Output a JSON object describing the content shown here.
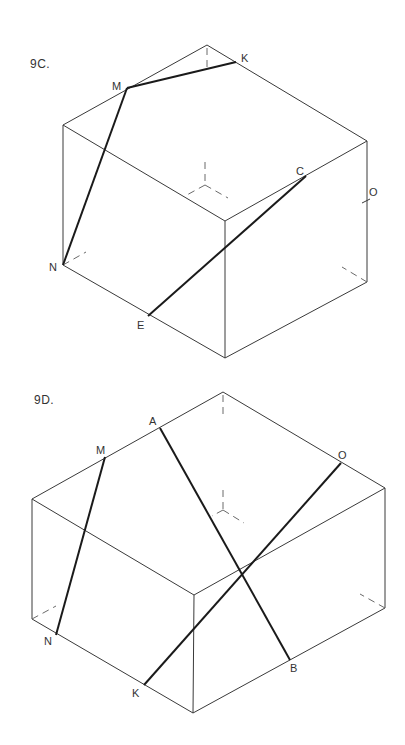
{
  "figures": [
    {
      "id": "9C",
      "title": "9C.",
      "shape": "cube",
      "vertices": {
        "top": [
          207,
          45
        ],
        "left_top": [
          63,
          125
        ],
        "right_top": [
          367,
          141
        ],
        "front_top": [
          225,
          221
        ],
        "left_bottom": [
          63,
          265
        ],
        "right_bottom": [
          367,
          282
        ],
        "bottom": [
          225,
          358
        ],
        "hidden": [
          205,
          185
        ]
      },
      "points": [
        {
          "label": "M",
          "pos": [
            127,
            88
          ],
          "label_pos": [
            112,
            89
          ]
        },
        {
          "label": "K",
          "pos": [
            236,
            62
          ],
          "label_pos": [
            242,
            62
          ]
        },
        {
          "label": "N",
          "pos": [
            63,
            265
          ],
          "label_pos": [
            49,
            271
          ]
        },
        {
          "label": "E",
          "pos": [
            148,
            316
          ],
          "label_pos": [
            138,
            329
          ]
        },
        {
          "label": "C",
          "pos": [
            306,
            176
          ],
          "label_pos": [
            296,
            175
          ]
        },
        {
          "label": "O",
          "pos": [
            367,
            200
          ],
          "label_pos": [
            369,
            196
          ]
        }
      ],
      "lines": [
        {
          "from": "M",
          "to": "K"
        },
        {
          "from": "M",
          "to": "N"
        },
        {
          "from": "E",
          "to": "C"
        }
      ]
    },
    {
      "id": "9D",
      "title": "9D.",
      "shape": "rectangular-prism",
      "vertices": {
        "top": [
          223,
          392
        ],
        "left_top": [
          32,
          499
        ],
        "right_top": [
          385,
          488
        ],
        "front_top": [
          194,
          595
        ],
        "left_bottom": [
          32,
          619
        ],
        "right_bottom": [
          385,
          608
        ],
        "bottom": [
          193,
          713
        ],
        "hidden": [
          223,
          510
        ]
      },
      "points": [
        {
          "label": "A",
          "pos": [
            160,
            428
          ],
          "label_pos": [
            149,
            425
          ]
        },
        {
          "label": "M",
          "pos": [
            105,
            457
          ],
          "label_pos": [
            96,
            455
          ]
        },
        {
          "label": "O",
          "pos": [
            341,
            463
          ],
          "label_pos": [
            339,
            459
          ]
        },
        {
          "label": "N",
          "pos": [
            56,
            635
          ],
          "label_pos": [
            44,
            645
          ]
        },
        {
          "label": "K",
          "pos": [
            144,
            685
          ],
          "label_pos": [
            132,
            696
          ]
        },
        {
          "label": "B",
          "pos": [
            290,
            660
          ],
          "label_pos": [
            291,
            672
          ]
        }
      ],
      "lines": [
        {
          "from": "M",
          "to": "N"
        },
        {
          "from": "A",
          "to": "B"
        },
        {
          "from": "K",
          "to": "O"
        }
      ]
    }
  ],
  "colors": {
    "edge": "#3a3a3a",
    "line": "#1a1a1a",
    "background": "#ffffff"
  }
}
